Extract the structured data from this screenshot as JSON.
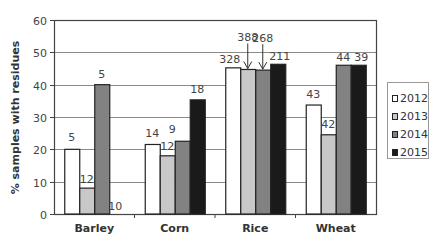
{
  "chart_data": {
    "type": "bar",
    "title": "",
    "xlabel": "",
    "ylabel": "% samples with residues",
    "ylim": [
      0,
      60
    ],
    "yticks": [
      0,
      10,
      20,
      30,
      40,
      50,
      60
    ],
    "grid": true,
    "legend_position": "right",
    "categories": [
      "Barley",
      "Corn",
      "Rice",
      "Wheat"
    ],
    "series": [
      {
        "name": "2012",
        "color": "#ffffff",
        "values": [
          20,
          21.5,
          45.2,
          33.7
        ],
        "labels": [
          "5",
          "14",
          "328",
          "43"
        ]
      },
      {
        "name": "2013",
        "color": "#c8c8c8",
        "values": [
          8,
          18,
          44.7,
          24.5
        ],
        "labels": [
          "12",
          "12",
          "388",
          "42"
        ]
      },
      {
        "name": "2014",
        "color": "#828282",
        "values": [
          40,
          22.5,
          44.5,
          46
        ],
        "labels": [
          "5",
          "9",
          "268",
          "44"
        ]
      },
      {
        "name": "2015",
        "color": "#1a1a1a",
        "values": [
          0,
          35.3,
          46.3,
          46
        ],
        "labels": [
          "10",
          "18",
          "211",
          "39"
        ]
      }
    ],
    "annotations": [
      {
        "text": "388",
        "type": "arrow",
        "target": "Rice 2013"
      },
      {
        "text": "268",
        "type": "arrow",
        "target": "Rice 2014"
      }
    ]
  },
  "ylabel": "% samples with residues",
  "legend": [
    {
      "label": "2012",
      "color": "#ffffff"
    },
    {
      "label": "2013",
      "color": "#c8c8c8"
    },
    {
      "label": "2014",
      "color": "#828282"
    },
    {
      "label": "2015",
      "color": "#1a1a1a"
    }
  ]
}
